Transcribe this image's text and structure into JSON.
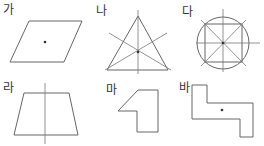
{
  "figures": [
    {
      "id": "ga",
      "label": "가",
      "shape": "parallelogram",
      "marks": "center point"
    },
    {
      "id": "na",
      "label": "나",
      "shape": "equilateral triangle",
      "marks": "three lines of symmetry with center point"
    },
    {
      "id": "da",
      "label": "다",
      "shape": "circle with inscribed square",
      "marks": "four lines of symmetry with center point"
    },
    {
      "id": "ra",
      "label": "라",
      "shape": "isosceles trapezoid",
      "marks": "one vertical line of symmetry"
    },
    {
      "id": "ma",
      "label": "마",
      "shape": "hexagon (notched)",
      "marks": "none"
    },
    {
      "id": "ba",
      "label": "바",
      "shape": "Z-shaped octagon",
      "marks": "center point"
    }
  ],
  "colors": {
    "line": "#666666",
    "symmetry_line": "#888888",
    "dot": "#333333",
    "text": "#333333"
  }
}
